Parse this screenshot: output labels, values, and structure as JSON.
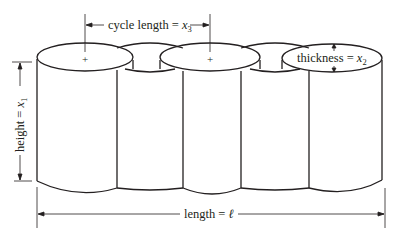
{
  "diagram": {
    "labels": {
      "cycle_length": {
        "text": "cycle length = ",
        "var": "x",
        "sub": "3"
      },
      "thickness": {
        "text": "thickness = ",
        "var": "x",
        "sub": "2"
      },
      "height": {
        "text": "height = ",
        "var": "x",
        "sub": "1"
      },
      "length": {
        "text": "length = ",
        "var": "ℓ"
      }
    },
    "markers": {
      "center_mark": "+"
    },
    "colors": {
      "stroke": "#231f20",
      "background": "#ffffff"
    }
  }
}
